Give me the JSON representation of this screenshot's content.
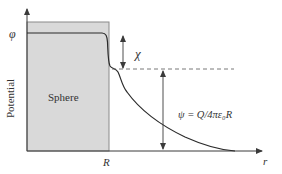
{
  "diagram": {
    "y_axis": {
      "label": "Potential",
      "tick_label": "φ"
    },
    "x_axis": {
      "label": "r",
      "tick_label": "R"
    },
    "sphere": {
      "label": "Sphere",
      "fill": "#d9d9d9",
      "edge": "#8a8a8a"
    },
    "annotations": {
      "chi": "χ",
      "psi": "ψ = Q/4πε₀R"
    },
    "colors": {
      "curve": "#2b2b2b",
      "axis": "#3a3a3a",
      "dashed": "#555555"
    }
  }
}
